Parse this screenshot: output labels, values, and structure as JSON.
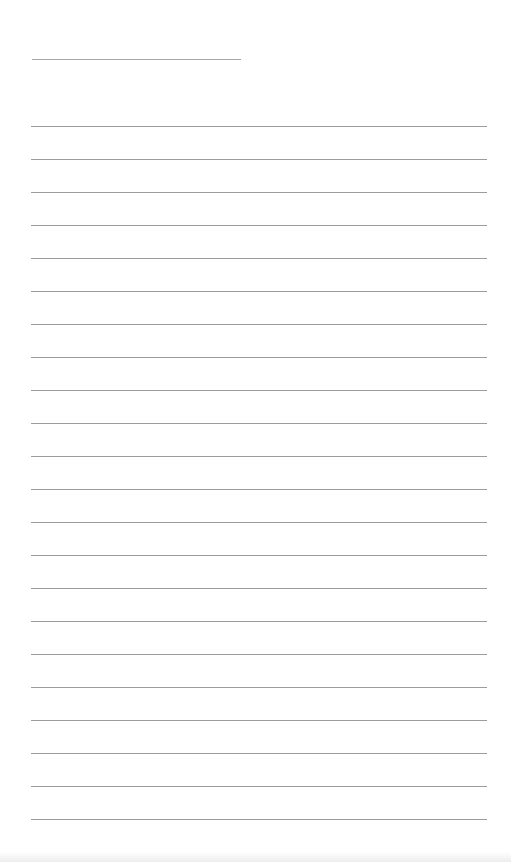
{
  "page": {
    "type": "lined-notepad-sheet",
    "background_color": "#ffffff",
    "line_color": "#9c9c9c",
    "title_line": {
      "x": 32,
      "y": 59,
      "width": 209
    },
    "ruled_lines": {
      "count": 22,
      "start_y": 126,
      "spacing": 33,
      "x": 31,
      "width": 456
    },
    "text": ""
  }
}
